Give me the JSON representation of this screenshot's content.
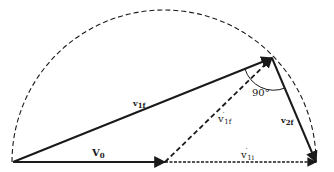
{
  "diagram": {
    "type": "vector-collision-diagram",
    "colors": {
      "stroke": "#1a1a1a",
      "background": "#ffffff"
    },
    "semicircle": {
      "style": "dashed",
      "center": [
        164,
        162
      ],
      "radius": 152
    },
    "points": {
      "origin": [
        13,
        162
      ],
      "midpoint": [
        165,
        162
      ],
      "right_end": [
        316,
        162
      ],
      "apex": [
        272,
        58
      ]
    },
    "vectors": [
      {
        "id": "v0",
        "from": "origin",
        "to": "midpoint",
        "style": "solid"
      },
      {
        "id": "v1i_prime",
        "from": "midpoint",
        "to": "right_end",
        "style": "dashed"
      },
      {
        "id": "v1f",
        "from": "origin",
        "to": "apex",
        "style": "solid"
      },
      {
        "id": "v1f_prime",
        "from": "midpoint",
        "to": "apex",
        "style": "dashed"
      },
      {
        "id": "v2f",
        "from": "apex",
        "to": "right_end",
        "style": "solid"
      }
    ],
    "labels": {
      "v1f": {
        "base": "v",
        "sub": "1f"
      },
      "v0": {
        "base": "V",
        "sub": "0"
      },
      "v1f_prime": {
        "base": "v",
        "prime": "′",
        "sub": "1f"
      },
      "v1i_prime": {
        "base": "v",
        "prime": "′",
        "sub": "1i"
      },
      "v2f": {
        "base": "v",
        "sub": "2f"
      },
      "angle": "90°"
    }
  }
}
